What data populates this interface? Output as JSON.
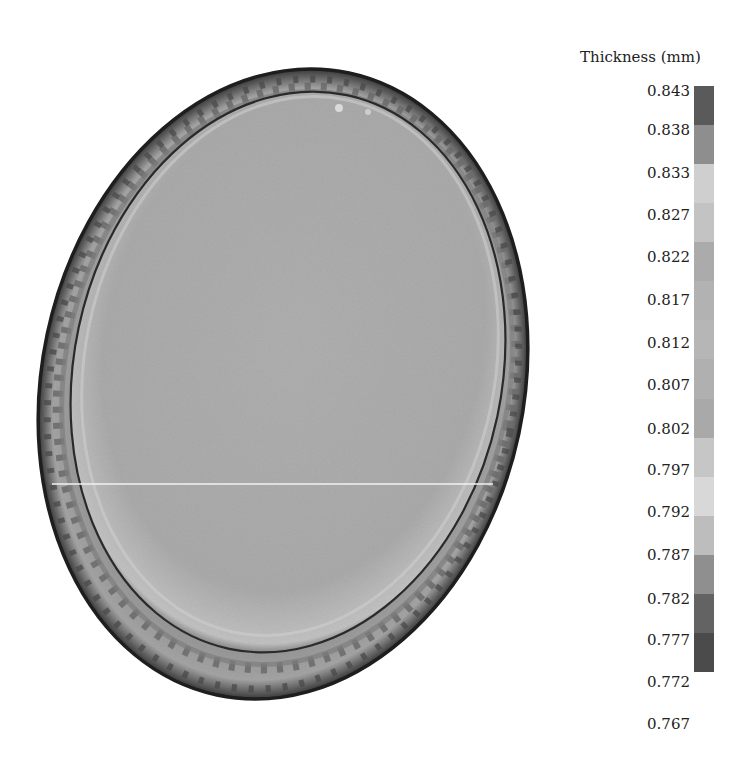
{
  "chart_data": {
    "type": "heatmap",
    "title": "",
    "subtitle": "",
    "legend": {
      "title": "Thickness (mm)",
      "position": "right",
      "ticks": [
        "0.843",
        "0.838",
        "0.833",
        "0.827",
        "0.822",
        "0.817",
        "0.812",
        "0.807",
        "0.802",
        "0.797",
        "0.792",
        "0.787",
        "0.782",
        "0.777",
        "0.772",
        "0.767"
      ],
      "range": [
        0.767,
        0.843
      ],
      "bands": [
        {
          "from": 0.838,
          "to": 0.843,
          "color": "#5a5a5a"
        },
        {
          "from": 0.833,
          "to": 0.838,
          "color": "#8e8e8e"
        },
        {
          "from": 0.827,
          "to": 0.833,
          "color": "#cfcfcf"
        },
        {
          "from": 0.822,
          "to": 0.827,
          "color": "#c3c3c3"
        },
        {
          "from": 0.817,
          "to": 0.822,
          "color": "#ababab"
        },
        {
          "from": 0.812,
          "to": 0.817,
          "color": "#b2b2b2"
        },
        {
          "from": 0.807,
          "to": 0.812,
          "color": "#b6b6b6"
        },
        {
          "from": 0.802,
          "to": 0.807,
          "color": "#b0b0b0"
        },
        {
          "from": 0.797,
          "to": 0.802,
          "color": "#a9a9a9"
        },
        {
          "from": 0.792,
          "to": 0.797,
          "color": "#c6c6c6"
        },
        {
          "from": 0.787,
          "to": 0.792,
          "color": "#d8d8d8"
        },
        {
          "from": 0.782,
          "to": 0.787,
          "color": "#bdbdbd"
        },
        {
          "from": 0.777,
          "to": 0.782,
          "color": "#8f8f8f"
        },
        {
          "from": 0.772,
          "to": 0.777,
          "color": "#636363"
        },
        {
          "from": 0.767,
          "to": 0.772,
          "color": "#4b4b4b"
        }
      ]
    },
    "regions": [
      {
        "name": "cup-bottom (flat face)",
        "approx_thickness_mm": 0.8,
        "color": "#ababab"
      },
      {
        "name": "punch-radius ring",
        "approx_thickness_mm": 0.78,
        "color": "#5a5a5a"
      },
      {
        "name": "cup wall",
        "approx_thickness_mm": 0.79,
        "color": "#a0a0a0"
      },
      {
        "name": "wall rim outline",
        "approx_thickness_mm": 0.77,
        "color": "#222222"
      }
    ],
    "xlabel": "",
    "ylabel": "",
    "grid": false
  },
  "legend_title": "Thickness (mm)"
}
